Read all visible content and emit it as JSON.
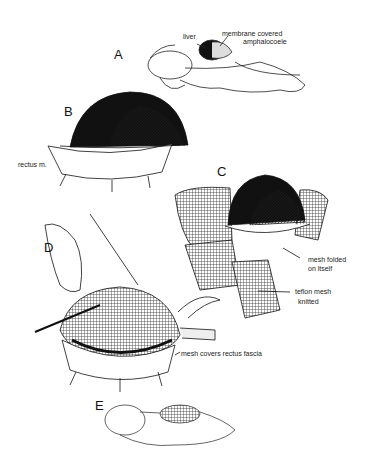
{
  "figure": {
    "panels": [
      {
        "id": "A",
        "letter": "A",
        "labels": [
          "liver",
          "membrane covered",
          "amphalocoele"
        ]
      },
      {
        "id": "B",
        "letter": "B",
        "labels": [
          "rectus m."
        ]
      },
      {
        "id": "C",
        "letter": "C",
        "labels": [
          "mesh folded",
          "on itself",
          "teflon mesh",
          "knitted"
        ]
      },
      {
        "id": "D",
        "letter": "D",
        "labels": [
          "mesh covers rectus fascia"
        ]
      },
      {
        "id": "E",
        "letter": "E",
        "labels": []
      }
    ],
    "colors": {
      "ink": "#111111",
      "background": "#ffffff"
    }
  }
}
